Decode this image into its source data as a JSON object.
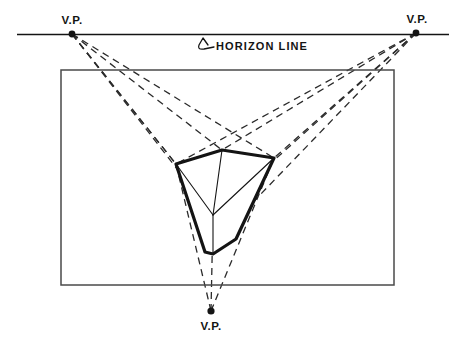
{
  "medium": "hand-drawn pencil/ink line drawing on white paper",
  "canvas": {
    "width": 458,
    "height": 343,
    "background": "#ffffff"
  },
  "colors": {
    "ink": "#141414",
    "frame_line": "#4a4a4a",
    "construction_line": "#2b2b2b",
    "paper": "#ffffff"
  },
  "labels": {
    "vanishing_point_left": "V.P.",
    "vanishing_point_right": "V.P.",
    "vanishing_point_bottom": "V.P.",
    "horizon_line": "HORIZON LINE"
  },
  "chart_data": {
    "type": "diagram",
    "horizon_line": {
      "label": "HORIZON LINE",
      "y": 34.5,
      "x_start": 17,
      "x_end": 449,
      "stroke_width": 1.6
    },
    "vanishing_points": [
      {
        "id": "vp-left",
        "label": "V.P.",
        "x": 72,
        "y": 34,
        "label_x": 72,
        "label_y": 24,
        "dot_r": 3.4
      },
      {
        "id": "vp-right",
        "label": "V.P.",
        "x": 416,
        "y": 33,
        "label_x": 417,
        "label_y": 23,
        "dot_r": 3.4
      },
      {
        "id": "vp-bottom",
        "label": "V.P.",
        "x": 211,
        "y": 311,
        "label_x": 211,
        "label_y": 330,
        "dot_r": 3.6
      }
    ],
    "picture_frame": {
      "label": "picture plane rectangle",
      "x": 61,
      "y": 70,
      "width": 333,
      "height": 215,
      "stroke_width": 1.5
    },
    "cube": {
      "label": "cube in three-point perspective",
      "stroke_width": 3.2,
      "vertices": {
        "top": {
          "x": 222,
          "y": 150
        },
        "left": {
          "x": 176,
          "y": 164
        },
        "right": {
          "x": 274,
          "y": 158
        },
        "center": {
          "x": 213,
          "y": 215
        },
        "bottom_left": {
          "x": 205,
          "y": 252
        },
        "bottom_right": {
          "x": 236,
          "y": 239
        },
        "bottom": {
          "x": 213,
          "y": 254
        }
      },
      "outline_path": "M 176 164 L 222 150 L 274 158 L 236 239 L 213 254 L 205 252 Z",
      "interior_edges": [
        {
          "from": "left",
          "to": "center",
          "stroke_width": 1.1
        },
        {
          "from": "right",
          "to": "center",
          "stroke_width": 1.1
        },
        {
          "from": "top",
          "to": "center",
          "stroke_width": 1.1
        },
        {
          "from": "center",
          "to": "bottom",
          "stroke_width": 1.1
        }
      ]
    },
    "construction_rays": {
      "style": "dashed",
      "dash_pattern": "7 5",
      "stroke_width": 1.3,
      "from_vp_left": [
        {
          "x1": 72,
          "y1": 34,
          "x2": 222,
          "y2": 150
        },
        {
          "x1": 72,
          "y1": 34,
          "x2": 176,
          "y2": 164
        },
        {
          "x1": 72,
          "y1": 34,
          "x2": 236,
          "y2": 239
        },
        {
          "x1": 72,
          "y1": 34,
          "x2": 213,
          "y2": 215
        },
        {
          "x1": 72,
          "y1": 34,
          "x2": 274,
          "y2": 158
        }
      ],
      "from_vp_right": [
        {
          "x1": 416,
          "y1": 33,
          "x2": 222,
          "y2": 150
        },
        {
          "x1": 416,
          "y1": 33,
          "x2": 274,
          "y2": 158
        },
        {
          "x1": 416,
          "y1": 33,
          "x2": 176,
          "y2": 164
        },
        {
          "x1": 416,
          "y1": 33,
          "x2": 213,
          "y2": 215
        },
        {
          "x1": 416,
          "y1": 33,
          "x2": 205,
          "y2": 252
        }
      ],
      "from_vp_bottom": [
        {
          "x1": 211,
          "y1": 311,
          "x2": 176,
          "y2": 164
        },
        {
          "x1": 211,
          "y1": 311,
          "x2": 274,
          "y2": 158
        },
        {
          "x1": 211,
          "y1": 311,
          "x2": 213,
          "y2": 215
        }
      ]
    },
    "leader_arrow": {
      "label": "horizon line leader arrow",
      "path": "M 208 45 L 203 38 L 199 45 Q 197 50 204 49 L 214 47",
      "stroke_width": 1.3
    },
    "text_positions": {
      "horizon_label_x": 216,
      "horizon_label_y": 50
    }
  }
}
